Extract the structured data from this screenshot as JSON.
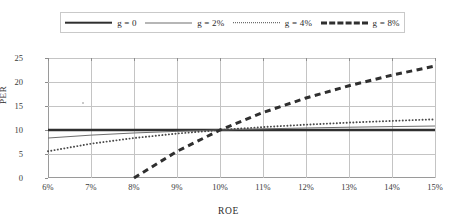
{
  "chart_data": {
    "type": "line",
    "title": "",
    "xlabel": "ROE",
    "ylabel": "PER",
    "xlim": [
      6,
      15
    ],
    "ylim": [
      0,
      25
    ],
    "grid": true,
    "legend_position": "top",
    "x": [
      6,
      7,
      8,
      9,
      10,
      11,
      12,
      13,
      14,
      15
    ],
    "xtick_labels": [
      "6%",
      "7%",
      "8%",
      "9%",
      "10%",
      "11%",
      "12%",
      "13%",
      "14%",
      "15%"
    ],
    "ytick_labels": [
      "0",
      "5",
      "10",
      "15",
      "20",
      "25"
    ],
    "ytick_values": [
      0,
      5,
      10,
      15,
      20,
      25
    ],
    "series": [
      {
        "name": "g = 0",
        "style": "solid-thick",
        "color": "#2f2f2f",
        "values": [
          10.0,
          10.0,
          10.0,
          10.0,
          10.0,
          10.0,
          10.0,
          10.0,
          10.0,
          10.0
        ]
      },
      {
        "name": "g = 2%",
        "style": "solid-thin",
        "color": "#6e6e6e",
        "values": [
          8.33,
          8.93,
          9.38,
          9.72,
          10.0,
          10.23,
          10.42,
          10.58,
          10.71,
          10.83
        ]
      },
      {
        "name": "g = 4%",
        "style": "dotted",
        "color": "#4a4a4a",
        "values": [
          5.56,
          7.14,
          8.33,
          9.26,
          10.0,
          10.61,
          11.11,
          11.54,
          11.9,
          12.22
        ]
      },
      {
        "name": "g = 8%",
        "style": "dashed",
        "color": "#2f2f2f",
        "values": [
          null,
          null,
          0.0,
          5.56,
          10.0,
          13.64,
          16.67,
          19.23,
          21.43,
          23.33
        ]
      }
    ]
  },
  "legend": {
    "entries": [
      {
        "label": "g = 0"
      },
      {
        "label": "g = 2%"
      },
      {
        "label": "g = 4%"
      },
      {
        "label": "g = 8%"
      }
    ]
  }
}
